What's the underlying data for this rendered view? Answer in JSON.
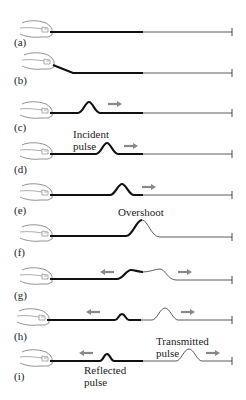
{
  "diagram": {
    "type": "wave-pulse-on-rope-sequence",
    "colors": {
      "thick_rope": "#111111",
      "thin_rope": "#333333",
      "arrow": "#888888",
      "hand": "#777777",
      "text": "#222222"
    },
    "panels": [
      {
        "label": "(a)",
        "y": 32,
        "label_y": 46
      },
      {
        "label": "(b)",
        "y": 72,
        "label_y": 84
      },
      {
        "label": "(c)",
        "y": 113,
        "label_y": 131
      },
      {
        "label": "(d)",
        "y": 154,
        "label_y": 173
      },
      {
        "label": "(e)",
        "y": 195,
        "label_y": 214
      },
      {
        "label": "(f)",
        "y": 234,
        "label_y": 256
      },
      {
        "label": "(g)",
        "y": 276,
        "label_y": 299
      },
      {
        "label": "(h)",
        "y": 320,
        "label_y": 340
      },
      {
        "label": "(i)",
        "y": 361,
        "label_y": 380
      }
    ],
    "annotations": {
      "incident_1": "Incident",
      "incident_2": "pulse",
      "overshoot": "Overshoot",
      "transmitted_1": "Transmitted",
      "transmitted_2": "pulse",
      "reflected_1": "Reflected",
      "reflected_2": "pulse"
    }
  }
}
